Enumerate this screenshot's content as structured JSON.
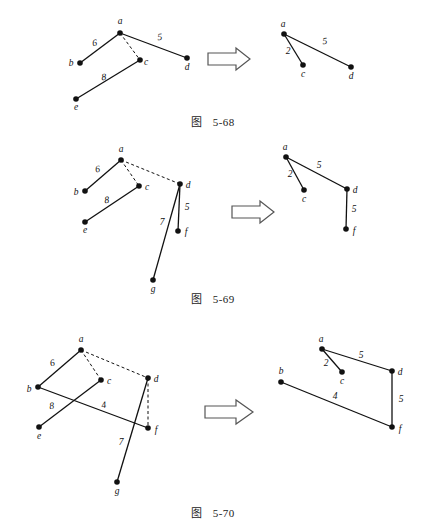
{
  "page": {
    "background": "#ffffff",
    "ink": "#111111",
    "width": 426,
    "height": 531
  },
  "figures": [
    {
      "id": "fig-5-68",
      "caption_prefix": "图",
      "caption_number": "5-68",
      "arrow": {
        "name": "implies-arrow",
        "glyph": "⇒"
      },
      "left": {
        "nodes": [
          {
            "id": "a",
            "label": "a",
            "x": 120,
            "y": 33,
            "lx": 120,
            "ly": 24
          },
          {
            "id": "b",
            "label": "b",
            "x": 80,
            "y": 63,
            "lx": 71,
            "ly": 66
          },
          {
            "id": "c",
            "label": "c",
            "x": 140,
            "y": 60,
            "lx": 146,
            "ly": 65
          },
          {
            "id": "d",
            "label": "d",
            "x": 187,
            "y": 58,
            "lx": 187,
            "ly": 70
          },
          {
            "id": "e",
            "label": "e",
            "x": 76,
            "y": 99,
            "lx": 76,
            "ly": 110
          }
        ],
        "edges": [
          {
            "from": "a",
            "to": "b",
            "weight": "6",
            "style": "solid",
            "wx": 95,
            "wy": 46
          },
          {
            "from": "a",
            "to": "d",
            "weight": "5",
            "style": "solid",
            "wx": 160,
            "wy": 40
          },
          {
            "from": "a",
            "to": "c",
            "weight": "",
            "style": "dashed",
            "wx": 0,
            "wy": 0
          },
          {
            "from": "c",
            "to": "e",
            "weight": "8",
            "style": "solid",
            "wx": 104,
            "wy": 80
          }
        ]
      },
      "right": {
        "nodes": [
          {
            "id": "a",
            "label": "a",
            "x": 284,
            "y": 34,
            "lx": 283,
            "ly": 26
          },
          {
            "id": "c",
            "label": "c",
            "x": 303,
            "y": 65,
            "lx": 303,
            "ly": 76
          },
          {
            "id": "d",
            "label": "d",
            "x": 351,
            "y": 67,
            "lx": 351,
            "ly": 78
          }
        ],
        "edges": [
          {
            "from": "a",
            "to": "c",
            "weight": "2",
            "style": "solid",
            "wx": 288,
            "wy": 52
          },
          {
            "from": "a",
            "to": "d",
            "weight": "5",
            "style": "solid",
            "wx": 323,
            "wy": 43
          }
        ]
      }
    },
    {
      "id": "fig-5-69",
      "caption_prefix": "图",
      "caption_number": "5-69",
      "arrow": {
        "name": "implies-arrow",
        "glyph": "⇒"
      },
      "left": {
        "nodes": [
          {
            "id": "a",
            "label": "a",
            "x": 121,
            "y": 160,
            "lx": 121,
            "ly": 151
          },
          {
            "id": "b",
            "label": "b",
            "x": 85,
            "y": 191,
            "lx": 76,
            "ly": 194
          },
          {
            "id": "c",
            "label": "c",
            "x": 139,
            "y": 186,
            "lx": 146,
            "ly": 190
          },
          {
            "id": "d",
            "label": "d",
            "x": 180,
            "y": 184,
            "lx": 187,
            "ly": 188
          },
          {
            "id": "e",
            "label": "e",
            "x": 85,
            "y": 222,
            "lx": 85,
            "ly": 233
          },
          {
            "id": "f",
            "label": "f",
            "x": 178,
            "y": 231,
            "lx": 185,
            "ly": 234
          },
          {
            "id": "g",
            "label": "g",
            "x": 153,
            "y": 280,
            "lx": 153,
            "ly": 291
          }
        ],
        "edges": [
          {
            "from": "a",
            "to": "b",
            "weight": "6",
            "style": "solid",
            "wx": 98,
            "wy": 172
          },
          {
            "from": "a",
            "to": "c",
            "weight": "",
            "style": "dashed",
            "wx": 0,
            "wy": 0
          },
          {
            "from": "a",
            "to": "d",
            "weight": "",
            "style": "dashed",
            "wx": 0,
            "wy": 0
          },
          {
            "from": "c",
            "to": "e",
            "weight": "8",
            "style": "solid",
            "wx": 107,
            "wy": 202
          },
          {
            "from": "d",
            "to": "f",
            "weight": "5",
            "style": "solid",
            "wx": 186,
            "wy": 209
          },
          {
            "from": "d",
            "to": "g",
            "weight": "7",
            "style": "solid",
            "wx": 163,
            "wy": 225
          }
        ]
      },
      "right": {
        "nodes": [
          {
            "id": "a",
            "label": "a",
            "x": 286,
            "y": 157,
            "lx": 285,
            "ly": 149
          },
          {
            "id": "c",
            "label": "c",
            "x": 304,
            "y": 190,
            "lx": 304,
            "ly": 201
          },
          {
            "id": "d",
            "label": "d",
            "x": 347,
            "y": 189,
            "lx": 354,
            "ly": 193
          },
          {
            "id": "f",
            "label": "f",
            "x": 346,
            "y": 229,
            "lx": 353,
            "ly": 233
          }
        ],
        "edges": [
          {
            "from": "a",
            "to": "c",
            "weight": "2",
            "style": "solid",
            "wx": 290,
            "wy": 175
          },
          {
            "from": "a",
            "to": "d",
            "weight": "5",
            "style": "solid",
            "wx": 318,
            "wy": 167
          },
          {
            "from": "d",
            "to": "f",
            "weight": "5",
            "style": "solid",
            "wx": 354,
            "wy": 210
          }
        ]
      }
    },
    {
      "id": "fig-5-70",
      "caption_prefix": "图",
      "caption_number": "5-70",
      "arrow": {
        "name": "implies-arrow",
        "glyph": "⇒"
      },
      "left": {
        "nodes": [
          {
            "id": "a",
            "label": "a",
            "x": 81,
            "y": 350,
            "lx": 81,
            "ly": 341
          },
          {
            "id": "b",
            "label": "b",
            "x": 38,
            "y": 387,
            "lx": 29,
            "ly": 391
          },
          {
            "id": "c",
            "label": "c",
            "x": 101,
            "y": 380,
            "lx": 108,
            "ly": 384
          },
          {
            "id": "d",
            "label": "d",
            "x": 148,
            "y": 378,
            "lx": 155,
            "ly": 382
          },
          {
            "id": "e",
            "label": "e",
            "x": 39,
            "y": 427,
            "lx": 39,
            "ly": 438
          },
          {
            "id": "f",
            "label": "f",
            "x": 148,
            "y": 428,
            "lx": 155,
            "ly": 432
          },
          {
            "id": "g",
            "label": "g",
            "x": 117,
            "y": 482,
            "lx": 117,
            "ly": 493
          }
        ],
        "edges": [
          {
            "from": "a",
            "to": "b",
            "weight": "6",
            "style": "solid",
            "wx": 53,
            "wy": 366
          },
          {
            "from": "a",
            "to": "c",
            "weight": "",
            "style": "dashed",
            "wx": 0,
            "wy": 0
          },
          {
            "from": "a",
            "to": "d",
            "weight": "",
            "style": "dashed",
            "wx": 0,
            "wy": 0
          },
          {
            "from": "c",
            "to": "e",
            "weight": "8",
            "style": "solid",
            "wx": 52,
            "wy": 408
          },
          {
            "from": "b",
            "to": "f",
            "weight": "4",
            "style": "solid",
            "wx": 104,
            "wy": 408
          },
          {
            "from": "d",
            "to": "f",
            "weight": "",
            "style": "dashed",
            "wx": 0,
            "wy": 0
          },
          {
            "from": "d",
            "to": "g",
            "weight": "7",
            "style": "solid",
            "wx": 122,
            "wy": 444
          }
        ]
      },
      "right": {
        "nodes": [
          {
            "id": "a",
            "label": "a",
            "x": 322,
            "y": 349,
            "lx": 321,
            "ly": 341
          },
          {
            "id": "b",
            "label": "b",
            "x": 281,
            "y": 382,
            "lx": 281,
            "ly": 372
          },
          {
            "id": "c",
            "label": "c",
            "x": 342,
            "y": 372,
            "lx": 342,
            "ly": 384
          },
          {
            "id": "d",
            "label": "d",
            "x": 392,
            "y": 371,
            "lx": 399,
            "ly": 375
          },
          {
            "id": "f",
            "label": "f",
            "x": 392,
            "y": 427,
            "lx": 399,
            "ly": 431
          }
        ],
        "edges": [
          {
            "from": "a",
            "to": "c",
            "weight": "2",
            "style": "solid",
            "wx": 326,
            "wy": 365
          },
          {
            "from": "a",
            "to": "d",
            "weight": "5",
            "style": "solid",
            "wx": 360,
            "wy": 357
          },
          {
            "from": "b",
            "to": "f",
            "weight": "4",
            "style": "solid",
            "wx": 334,
            "wy": 398
          },
          {
            "from": "d",
            "to": "f",
            "weight": "5",
            "style": "solid",
            "wx": 400,
            "wy": 400
          }
        ]
      }
    }
  ],
  "arrows": [
    {
      "name": "arrow-5-68",
      "x": 208,
      "y": 50,
      "w": 42,
      "h": 18
    },
    {
      "name": "arrow-5-69",
      "x": 232,
      "y": 203,
      "w": 42,
      "h": 18
    },
    {
      "name": "arrow-5-70",
      "x": 205,
      "y": 402,
      "w": 48,
      "h": 20
    }
  ]
}
